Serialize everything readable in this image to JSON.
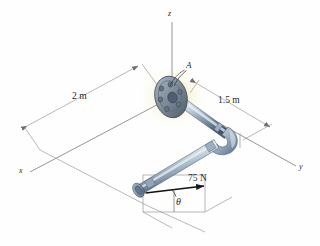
{
  "figure": {
    "type": "engineering-mechanics-diagram",
    "axes": {
      "x_label": "x",
      "y_label": "y",
      "z_label": "z"
    },
    "points": {
      "flange_label": "A"
    },
    "dimensions": [
      {
        "id": "seg-1",
        "label": "2 m"
      },
      {
        "id": "seg-2",
        "label": "1.5 m"
      }
    ],
    "force": {
      "magnitude_label": "75 N",
      "angle_label": "θ"
    },
    "colors": {
      "pipe_light": "#cfdae6",
      "pipe_mid": "#9fb2c6",
      "pipe_dark": "#5e7siege",
      "pipe_edge": "#44566b",
      "flange_face": "#8c9bab",
      "flange_dark": "#56646f",
      "glow": "#f2ecc0",
      "line": "#8a8a8a",
      "text": "#2a2a2a"
    }
  }
}
